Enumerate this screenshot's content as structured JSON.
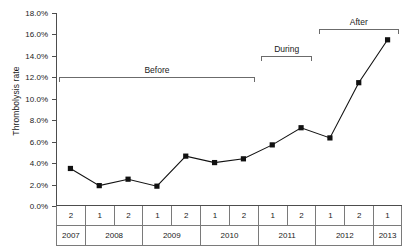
{
  "chart_data": {
    "type": "line",
    "title": "",
    "xlabel": "",
    "ylabel": "Thrombolysis rate",
    "ylim": [
      0,
      18
    ],
    "ytick_labels": [
      "18.0%",
      "16.0%",
      "14.0%",
      "12.0%",
      "10.0%",
      "8.0%",
      "6.0%",
      "4.0%",
      "2.0%",
      "0.0%"
    ],
    "ytick_values": [
      18,
      16,
      14,
      12,
      10,
      8,
      6,
      4,
      2,
      0
    ],
    "grid": false,
    "legend": "none",
    "marker": "filled-square",
    "line_color": "#111111",
    "marker_color": "#111111",
    "categories": [
      "2007-2",
      "2008-1",
      "2008-2",
      "2009-1",
      "2009-2",
      "2010-1",
      "2010-2",
      "2011-1",
      "2011-2",
      "2012-1",
      "2012-2",
      "2013-1"
    ],
    "values": [
      3.5,
      1.9,
      2.5,
      1.85,
      4.65,
      4.05,
      4.4,
      5.7,
      7.3,
      6.35,
      11.5,
      15.5
    ],
    "x_axis_half_labels": [
      "2",
      "1",
      "2",
      "1",
      "2",
      "1",
      "2",
      "1",
      "2",
      "1",
      "2",
      "1"
    ],
    "x_axis_years": [
      {
        "label": "2007",
        "span": 1
      },
      {
        "label": "2008",
        "span": 2
      },
      {
        "label": "2009",
        "span": 2
      },
      {
        "label": "2010",
        "span": 2
      },
      {
        "label": "2011",
        "span": 2
      },
      {
        "label": "2012",
        "span": 2
      },
      {
        "label": "2013",
        "span": 1
      }
    ],
    "annotations": [
      {
        "label": "Before",
        "start_category": "2007-2",
        "end_category": "2010-2",
        "y_level": 12.0
      },
      {
        "label": "During",
        "start_category": "2011-1",
        "end_category": "2011-2",
        "y_level": 14.0
      },
      {
        "label": "After",
        "start_category": "2012-1",
        "end_category": "2013-1",
        "y_level": 16.5
      }
    ]
  }
}
